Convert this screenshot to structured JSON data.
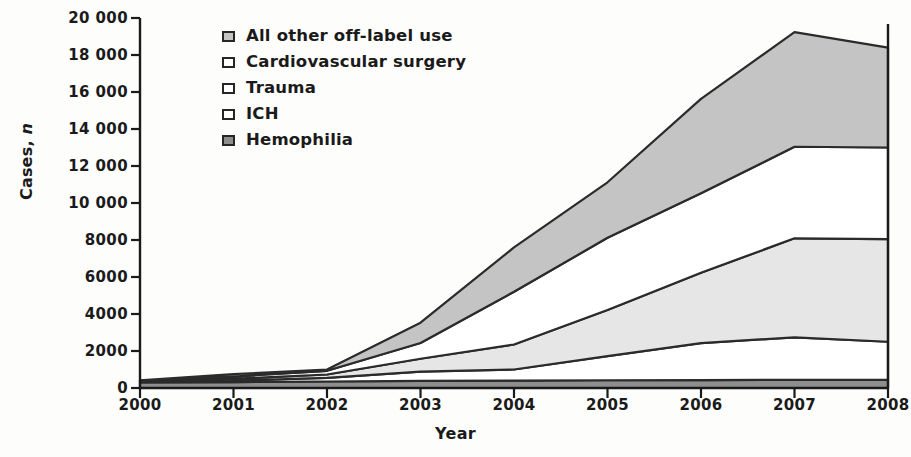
{
  "chart_data": {
    "type": "area",
    "stacked": true,
    "title": "",
    "xlabel": "Year",
    "ylabel": "Cases, n",
    "grid": false,
    "legend_position": "top-left-inside",
    "categories": [
      "2000",
      "2001",
      "2002",
      "2003",
      "2004",
      "2005",
      "2006",
      "2007",
      "2008"
    ],
    "x": [
      2000,
      2001,
      2002,
      2003,
      2004,
      2005,
      2006,
      2007,
      2008
    ],
    "ylim": [
      0,
      20000
    ],
    "xlim": [
      2000,
      2008
    ],
    "yticks": [
      0,
      2000,
      4000,
      6000,
      8000,
      10000,
      12000,
      14000,
      16000,
      18000,
      20000
    ],
    "ytick_labels": [
      "0",
      "2000",
      "4000",
      "6000",
      "8000",
      "10 000",
      "12 000",
      "14 000",
      "16 000",
      "18 000",
      "20 000"
    ],
    "xticks": [
      2000,
      2001,
      2002,
      2003,
      2004,
      2005,
      2006,
      2007,
      2008
    ],
    "xtick_labels": [
      "2000",
      "2001",
      "2002",
      "2003",
      "2004",
      "2005",
      "2006",
      "2007",
      "2008"
    ],
    "series": [
      {
        "name": "Hemophilia",
        "values": [
          300,
          320,
          350,
          380,
          400,
          420,
          430,
          440,
          450
        ],
        "color": "#8e8e8e",
        "swatch": "filled-dark-gray",
        "stack_order": 1
      },
      {
        "name": "ICH",
        "values": [
          40,
          80,
          200,
          500,
          600,
          1300,
          2000,
          2300,
          2050
        ],
        "color": "#ffffff",
        "swatch": "white",
        "stack_order": 2
      },
      {
        "name": "Trauma",
        "values": [
          30,
          100,
          180,
          700,
          1350,
          2500,
          3800,
          5350,
          5550
        ],
        "color": "#e6e6e6",
        "swatch": "white",
        "stack_order": 3
      },
      {
        "name": "Cardiovascular surgery",
        "values": [
          20,
          120,
          200,
          850,
          2850,
          3900,
          4300,
          4950,
          4950
        ],
        "color": "#ffffff",
        "swatch": "white",
        "stack_order": 4
      },
      {
        "name": "All other off-label use",
        "values": [
          20,
          130,
          70,
          1100,
          2400,
          3000,
          5100,
          6200,
          5400
        ],
        "color": "#c4c4c4",
        "swatch": "filled-light-gray",
        "stack_order": 5
      }
    ],
    "cumulative_tops": {
      "hemophilia": [
        300,
        320,
        350,
        380,
        400,
        420,
        430,
        440,
        450
      ],
      "ich": [
        340,
        400,
        550,
        880,
        1000,
        1720,
        2430,
        2740,
        2500
      ],
      "trauma": [
        370,
        500,
        730,
        1580,
        2350,
        4220,
        6230,
        8090,
        8050
      ],
      "cardiovascular_surgery": [
        390,
        620,
        930,
        2430,
        5200,
        8120,
        10530,
        13040,
        13000
      ],
      "total": [
        410,
        750,
        1000,
        3530,
        7600,
        11120,
        15630,
        19240,
        18400
      ]
    },
    "totals": [
      410,
      750,
      1000,
      3530,
      7600,
      11120,
      15630,
      19240,
      18400
    ]
  },
  "legend": {
    "items": [
      {
        "label": "All other off-label use",
        "fill": "#c4c4c4"
      },
      {
        "label": "Cardiovascular surgery",
        "fill": "#ffffff"
      },
      {
        "label": "Trauma",
        "fill": "#ffffff"
      },
      {
        "label": "ICH",
        "fill": "#ffffff"
      },
      {
        "label": "Hemophilia",
        "fill": "#8e8e8e"
      }
    ]
  },
  "axes": {
    "y_title_prefix": "Cases, ",
    "y_title_italic": "n",
    "x_title": "Year"
  },
  "colors": {
    "axis": "#1a1a1a",
    "outline": "#2b2b2b",
    "band_dark": "#8e8e8e",
    "band_light": "#c4c4c4",
    "band_pale": "#e6e6e6",
    "band_white": "#ffffff",
    "background": "#fdfdfc"
  }
}
